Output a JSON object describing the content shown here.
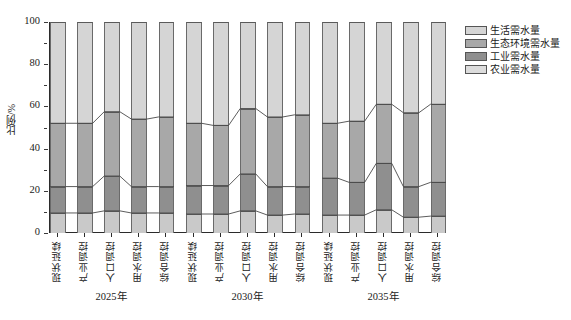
{
  "chart_data": {
    "type": "bar",
    "subtype": "stacked-percentage",
    "title": "",
    "xlabel": "",
    "ylabel": "比例/%",
    "ylim": [
      0,
      100
    ],
    "yticks": [
      0,
      20,
      40,
      60,
      80,
      100
    ],
    "ytick_labels": [
      "0",
      "20",
      "40",
      "60",
      "80",
      "100"
    ],
    "grid": false,
    "legend_position": "right-top",
    "stack_order_bottom_to_top": [
      "农业需水量",
      "工业需水量",
      "生态环境需水量",
      "生活需水量"
    ],
    "groups": [
      {
        "label": "2025年",
        "categories": [
          "现状延续",
          "产业调控",
          "人口调控",
          "用水调控",
          "综合调控"
        ]
      },
      {
        "label": "2030年",
        "categories": [
          "现状延续",
          "产业调控",
          "人口调控",
          "用水调控",
          "综合调控"
        ]
      },
      {
        "label": "2035年",
        "categories": [
          "现状延续",
          "产业调控",
          "人口调控",
          "用水调控",
          "综合调控"
        ]
      }
    ],
    "series": [
      {
        "name": "农业需水量",
        "color": "#c9c9c9",
        "values": [
          [
            9.5,
            9.5,
            10.5,
            9.5,
            9.5
          ],
          [
            9.0,
            9.0,
            10.5,
            8.5,
            9.0
          ],
          [
            8.5,
            8.5,
            11.0,
            7.5,
            8.0
          ]
        ]
      },
      {
        "name": "工业需水量",
        "color": "#8f8f8f",
        "values": [
          [
            12.5,
            12.5,
            16.5,
            12.5,
            12.5
          ],
          [
            13.5,
            13.5,
            17.5,
            13.5,
            13.0
          ],
          [
            17.5,
            15.5,
            22.0,
            14.5,
            16.0
          ]
        ]
      },
      {
        "name": "生态环境需水量",
        "color": "#a8a8a8",
        "values": [
          [
            30.0,
            30.0,
            30.5,
            32.0,
            33.0
          ],
          [
            29.5,
            28.5,
            31.0,
            33.0,
            34.0
          ],
          [
            26.0,
            29.0,
            28.0,
            35.0,
            37.0
          ]
        ]
      },
      {
        "name": "生活需水量",
        "color": "#d5d5d5",
        "values": [
          [
            48.0,
            48.0,
            42.5,
            46.0,
            45.0
          ],
          [
            48.0,
            49.0,
            41.0,
            45.0,
            44.0
          ],
          [
            48.0,
            47.0,
            39.0,
            43.0,
            39.0
          ]
        ]
      }
    ]
  },
  "legend": {
    "items": [
      {
        "label": "生活需水量",
        "color": "#d5d5d5"
      },
      {
        "label": "生态环境需水量",
        "color": "#a8a8a8"
      },
      {
        "label": "工业需水量",
        "color": "#8f8f8f"
      },
      {
        "label": "农业需水量",
        "color": "#dcdcdc"
      }
    ]
  }
}
